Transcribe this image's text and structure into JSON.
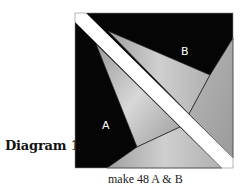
{
  "diagram": {
    "title": "Diagram 1",
    "caption": "make 48 A & B",
    "pieces": [
      {
        "id": "A",
        "label": "A",
        "color": "#000000"
      },
      {
        "id": "B",
        "label": "B",
        "color": "#000000"
      }
    ],
    "colors": {
      "black": "#050505",
      "gray_light": "#c8c8c8",
      "gray_mid": "#a8a8a8",
      "stripe": "#ffffff",
      "line": "#222222"
    }
  }
}
